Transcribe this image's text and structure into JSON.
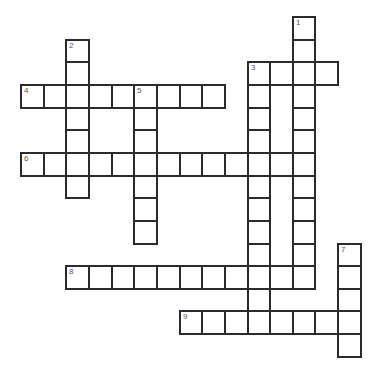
{
  "puzzle": {
    "type": "crossword",
    "grid": {
      "origin_x": 21,
      "origin_y": 17,
      "pitch": 22.65,
      "rows": 15,
      "cols": 15
    },
    "words": [
      {
        "number": "1",
        "direction": "down",
        "row": 0,
        "col": 12,
        "length": 12
      },
      {
        "number": "2",
        "direction": "down",
        "row": 1,
        "col": 2,
        "length": 7
      },
      {
        "number": "3",
        "direction": "across",
        "row": 2,
        "col": 10,
        "length": 4
      },
      {
        "number": "3",
        "direction": "down",
        "row": 2,
        "col": 10,
        "length": 12
      },
      {
        "number": "4",
        "direction": "across",
        "row": 3,
        "col": 0,
        "length": 9
      },
      {
        "number": "5",
        "direction": "down",
        "row": 3,
        "col": 5,
        "length": 7
      },
      {
        "number": "6",
        "direction": "across",
        "row": 6,
        "col": 0,
        "length": 13
      },
      {
        "number": "7",
        "direction": "down",
        "row": 10,
        "col": 14,
        "length": 5
      },
      {
        "number": "8",
        "direction": "across",
        "row": 11,
        "col": 2,
        "length": 11
      },
      {
        "number": "9",
        "direction": "across",
        "row": 13,
        "col": 7,
        "length": 8
      }
    ],
    "colors": {
      "border": "#2b2b2b",
      "number": "#555555",
      "background": "#ffffff"
    }
  }
}
